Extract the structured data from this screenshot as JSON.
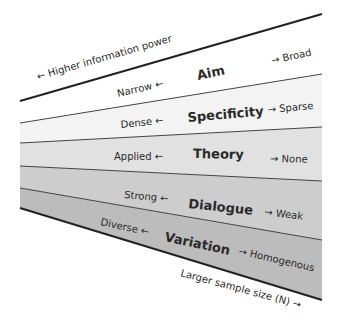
{
  "diagram": {
    "top_label": "← Higher information power",
    "bottom_label": "Larger sample size (N) →",
    "bands": [
      {
        "name": "Aim",
        "left": "Narrow ←",
        "right": "→ Broad",
        "color": "#ffffff"
      },
      {
        "name": "Specificity",
        "left": "Dense ←",
        "right": "→ Sparse",
        "color": "#f3f3f3"
      },
      {
        "name": "Theory",
        "left": "Applied ←",
        "right": "→ None",
        "color": "#e1e1e1"
      },
      {
        "name": "Dialogue",
        "left": "Strong ←",
        "right": "→ Weak",
        "color": "#cdcdcd"
      },
      {
        "name": "Variation",
        "left": "Diverse ←",
        "right": "→ Homogenous",
        "color": "#bcbcbc"
      }
    ],
    "line_color": "#333333"
  }
}
